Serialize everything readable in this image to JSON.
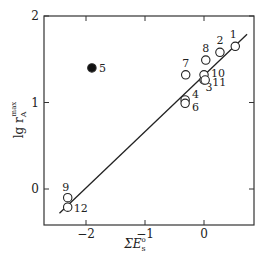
{
  "chart_data": {
    "type": "scatter",
    "title": "",
    "xlabel": "ΣE_s°",
    "ylabel": "lg r_A^max",
    "xlim": [
      -2.7,
      0.85
    ],
    "ylim": [
      -0.42,
      2.0
    ],
    "xticks": [
      -2,
      -1,
      0
    ],
    "yticks": [
      0,
      1,
      2
    ],
    "grid": false,
    "points": [
      {
        "label": "1",
        "x": 0.53,
        "y": 1.65,
        "filled": false
      },
      {
        "label": "2",
        "x": 0.27,
        "y": 1.58,
        "filled": false
      },
      {
        "label": "3",
        "x": 0.0,
        "y": 1.26,
        "filled": false
      },
      {
        "label": "4",
        "x": -0.32,
        "y": 1.03,
        "filled": false
      },
      {
        "label": "5",
        "x": -1.9,
        "y": 1.4,
        "filled": true
      },
      {
        "label": "6",
        "x": -0.32,
        "y": 0.99,
        "filled": false
      },
      {
        "label": "7",
        "x": -0.31,
        "y": 1.32,
        "filled": false
      },
      {
        "label": "8",
        "x": 0.03,
        "y": 1.49,
        "filled": false
      },
      {
        "label": "9",
        "x": -2.31,
        "y": -0.1,
        "filled": false
      },
      {
        "label": "10",
        "x": 0.0,
        "y": 1.32,
        "filled": false
      },
      {
        "label": "11",
        "x": 0.02,
        "y": 1.26,
        "filled": false
      },
      {
        "label": "12",
        "x": -2.31,
        "y": -0.21,
        "filled": false
      }
    ],
    "fit_line": {
      "x": [
        -2.45,
        0.73
      ],
      "y": [
        -0.28,
        1.79
      ]
    }
  },
  "labels": {
    "ylabel_main": "lg r",
    "ylabel_sup": "max",
    "ylabel_sub": "A",
    "xlabel_main": "ΣE",
    "xlabel_sup": "o",
    "xlabel_sub": "s",
    "xtick_labels": [
      "−2",
      "−1",
      "0"
    ],
    "ytick_labels": [
      "0",
      "1",
      "2"
    ]
  }
}
